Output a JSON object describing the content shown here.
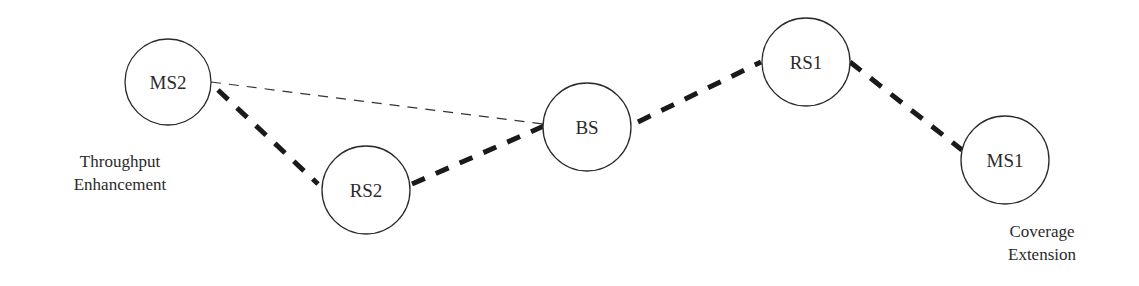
{
  "diagram": {
    "title": "",
    "nodes": [
      {
        "id": "MS2",
        "label": "MS2",
        "cx": 168,
        "cy": 82,
        "r": 43
      },
      {
        "id": "RS2",
        "label": "RS2",
        "cx": 366,
        "cy": 190,
        "r": 44
      },
      {
        "id": "BS",
        "label": "BS",
        "cx": 587,
        "cy": 127,
        "r": 44
      },
      {
        "id": "RS1",
        "label": "RS1",
        "cx": 806,
        "cy": 62,
        "r": 44
      },
      {
        "id": "MS1",
        "label": "MS1",
        "cx": 1005,
        "cy": 160,
        "r": 44
      }
    ],
    "links": [
      {
        "from": "MS2",
        "to": "BS",
        "style": "thin-dashed"
      },
      {
        "from": "MS2",
        "to": "RS2",
        "style": "thick-dashed"
      },
      {
        "from": "RS2",
        "to": "BS",
        "style": "thick-dashed"
      },
      {
        "from": "BS",
        "to": "RS1",
        "style": "thick-dashed"
      },
      {
        "from": "RS1",
        "to": "MS1",
        "style": "thick-dashed"
      }
    ],
    "annotations": {
      "throughput": {
        "line1": "Throughput",
        "line2": "Enhancement"
      },
      "coverage": {
        "line1": "Coverage",
        "line2": "Extension"
      }
    },
    "colors": {
      "stroke": "#2a2a2a",
      "thick_link": "#1a1a1a",
      "background": "#ffffff"
    }
  }
}
